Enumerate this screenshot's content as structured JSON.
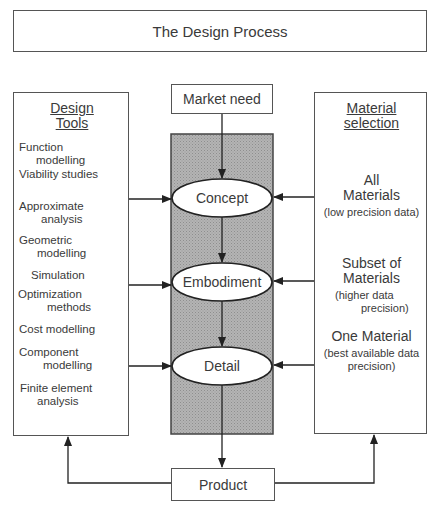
{
  "title": "The Design Process",
  "market_need": "Market need",
  "product": "Product",
  "stages": [
    "Concept",
    "Embodiment",
    "Detail"
  ],
  "design_tools": {
    "heading_line1": "Design",
    "heading_line2": "Tools",
    "items": [
      {
        "l1": "Function",
        "l2": "modelling"
      },
      {
        "l1": "Viability studies",
        "l2": ""
      },
      {
        "l1": "Approximate",
        "l2": "analysis"
      },
      {
        "l1": "Geometric",
        "l2": "modelling"
      },
      {
        "l1": "Simulation",
        "l2": ""
      },
      {
        "l1": "Optimization",
        "l2": "methods"
      },
      {
        "l1": "Cost modelling",
        "l2": ""
      },
      {
        "l1": "Component",
        "l2": "modelling"
      },
      {
        "l1": "Finite element",
        "l2": "analysis"
      }
    ]
  },
  "material_selection": {
    "heading_line1": "Material",
    "heading_line2": "selection",
    "items": [
      {
        "main1": "All",
        "main2": "Materials",
        "note1": "(low precision data)",
        "note2": ""
      },
      {
        "main1": "Subset of",
        "main2": "Materials",
        "note1": "(higher data",
        "note2": "precision)"
      },
      {
        "main1": "One Material",
        "main2": "",
        "note1": "(best available data",
        "note2": "precision)"
      }
    ]
  },
  "colors": {
    "line": "#333333",
    "shade": "#a9a9a9"
  }
}
